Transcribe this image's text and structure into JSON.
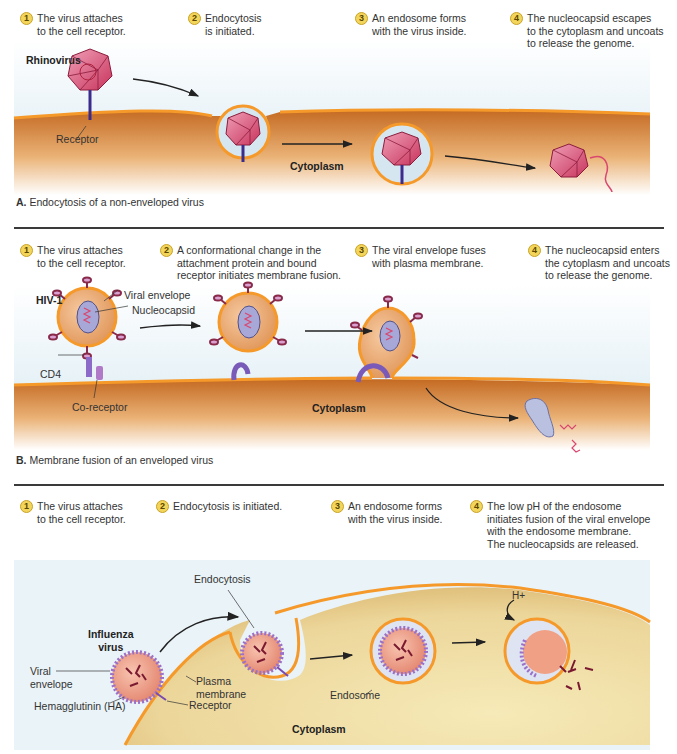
{
  "colors": {
    "sky": "#dcebf2",
    "cytoplasm_dark": "#c9722a",
    "cytoplasm_light": "#f7e0b8",
    "membrane": "#f59a2a",
    "virus_pink": "#d9476e",
    "step_badge": "#f2d55a",
    "receptor": "#4b3aa0",
    "influenza_cell": "#f3e2a8"
  },
  "panel_a": {
    "steps": [
      {
        "num": "1",
        "text": "The virus attaches\nto the cell receptor."
      },
      {
        "num": "2",
        "text": "Endocytosis\nis initiated."
      },
      {
        "num": "3",
        "text": "An endosome forms\nwith the virus inside."
      },
      {
        "num": "4",
        "text": "The nucleocapsid escapes\nto the cytoplasm and uncoats\nto release the genome."
      }
    ],
    "virus_label": "Rhinovirus",
    "receptor_label": "Receptor",
    "cytoplasm_label": "Cytoplasm",
    "caption_letter": "A.",
    "caption_text": "Endocytosis of a non-enveloped virus"
  },
  "panel_b": {
    "steps": [
      {
        "num": "1",
        "text": "The virus attaches\nto the cell receptor."
      },
      {
        "num": "2",
        "text": "A conformational change in the\nattachment protein and bound\nreceptor initiates membrane fusion."
      },
      {
        "num": "3",
        "text": "The viral envelope fuses\nwith plasma membrane."
      },
      {
        "num": "4",
        "text": "The nucleocapsid enters\nthe cytoplasm and uncoats\nto release the genome."
      }
    ],
    "virus_label": "HIV-1",
    "envelope_label": "Viral envelope",
    "nucleocapsid_label": "Nucleocapsid",
    "cd4_label": "CD4",
    "coreceptor_label": "Co-receptor",
    "cytoplasm_label": "Cytoplasm",
    "caption_letter": "B.",
    "caption_text": "Membrane fusion of an enveloped virus"
  },
  "panel_c": {
    "steps": [
      {
        "num": "1",
        "text": "The virus attaches\nto the cell receptor."
      },
      {
        "num": "2",
        "text": "Endocytosis is initiated."
      },
      {
        "num": "3",
        "text": "An endosome forms\nwith the virus inside."
      },
      {
        "num": "4",
        "text": "The low pH of the endosome\ninitiates fusion of the viral envelope\nwith the endosome membrane.\nThe nucleocapsids are released."
      }
    ],
    "virus_label": "Influenza\nvirus",
    "envelope_label": "Viral\nenvelope",
    "ha_label": "Hemagglutinin (HA)",
    "plasma_membrane_label": "Plasma\nmembrane",
    "receptor_label": "Receptor",
    "endocytosis_label": "Endocytosis",
    "endosome_label": "Endosome",
    "proton_label": "H+",
    "cytoplasm_label": "Cytoplasm"
  }
}
